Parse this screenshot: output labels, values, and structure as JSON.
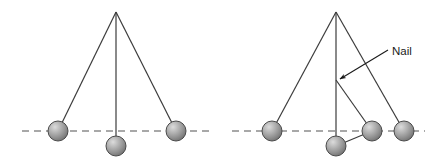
{
  "figure": {
    "type": "physics-diagram",
    "background_color": "#ffffff",
    "line_color": "#3c3c3c",
    "dashed_line_color": "#8c8c8c",
    "ball_fill_light": "#d2d2d2",
    "ball_fill_mid": "#9a9a9a",
    "ball_fill_dark": "#6e6e6e",
    "ball_stroke": "#4a4a4a",
    "text_color": "#1a1a1a"
  },
  "panels": [
    {
      "id": "left-panel",
      "name": "simple-pendulum",
      "pivot": {
        "x": 116,
        "y": 12
      },
      "dashed_line": {
        "x1": 22,
        "y1": 131,
        "x2": 212,
        "y2": 131
      },
      "strings": [
        {
          "name": "string-left-swing",
          "x1": 116,
          "y1": 12,
          "x2": 58,
          "y2": 131
        },
        {
          "name": "string-vertical",
          "x1": 116,
          "y1": 12,
          "x2": 116,
          "y2": 146
        },
        {
          "name": "string-right-swing",
          "x1": 116,
          "y1": 12,
          "x2": 176,
          "y2": 131
        }
      ],
      "bobs": [
        {
          "name": "bob-left",
          "cx": 58,
          "cy": 131,
          "r": 10
        },
        {
          "name": "bob-bottom",
          "cx": 116,
          "cy": 146,
          "r": 10
        },
        {
          "name": "bob-right",
          "cx": 176,
          "cy": 131,
          "r": 10
        }
      ]
    },
    {
      "id": "right-panel",
      "name": "pendulum-with-nail",
      "pivot": {
        "x": 336,
        "y": 12
      },
      "nail": {
        "x": 336,
        "y": 80
      },
      "dashed_line": {
        "x1": 232,
        "y1": 131,
        "x2": 425,
        "y2": 131
      },
      "strings": [
        {
          "name": "string-left-swing",
          "x1": 336,
          "y1": 12,
          "x2": 272,
          "y2": 131
        },
        {
          "name": "string-vertical",
          "x1": 336,
          "y1": 12,
          "x2": 336,
          "y2": 146
        },
        {
          "name": "string-right-swing",
          "x1": 336,
          "y1": 12,
          "x2": 404,
          "y2": 131
        },
        {
          "name": "string-nail-to-bob",
          "x1": 336,
          "y1": 80,
          "x2": 372,
          "y2": 131
        },
        {
          "name": "string-nail-to-bottom-bob",
          "x1": 336,
          "y1": 80,
          "x2": 336,
          "y2": 146
        }
      ],
      "bobs": [
        {
          "name": "bob-left",
          "cx": 272,
          "cy": 131,
          "r": 10
        },
        {
          "name": "bob-bottom",
          "cx": 336,
          "cy": 146,
          "r": 10
        },
        {
          "name": "bob-nail-arc",
          "cx": 372,
          "cy": 131,
          "r": 10
        },
        {
          "name": "bob-right",
          "cx": 404,
          "cy": 131,
          "r": 10
        }
      ],
      "annotation": {
        "label": "Nail",
        "label_x": 392,
        "label_y": 55,
        "leader": {
          "x1": 388,
          "y1": 50,
          "x2": 343,
          "y2": 78
        },
        "arrow_tip": {
          "x": 337,
          "y": 81
        }
      }
    }
  ]
}
